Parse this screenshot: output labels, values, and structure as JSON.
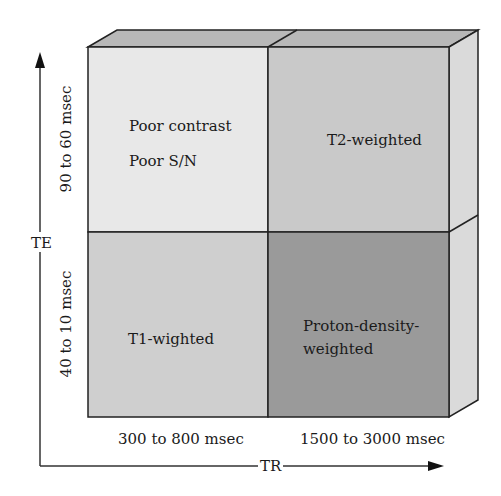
{
  "axes": {
    "y_label": "TE",
    "x_label": "TR",
    "y_ticks": [
      "90 to 60 msec",
      "40 to 10 msec"
    ],
    "x_ticks": [
      "300 to 800 msec",
      "1500 to 3000 msec"
    ]
  },
  "cells": {
    "top_left": {
      "line1": "Poor contrast",
      "line2": "Poor S/N",
      "color": "#e8e8e8"
    },
    "top_right": {
      "line1": "T2-weighted",
      "color": "#c9c9c9"
    },
    "bottom_left": {
      "line1": "T1-wighted",
      "color": "#cfcfcf"
    },
    "bottom_right": {
      "line1": "Proton-density-",
      "line2": "weighted",
      "color": "#9a9a9a"
    }
  },
  "colors": {
    "top_face": "#b5b5b5",
    "side_face": "#dadada",
    "edge": "#222222"
  }
}
